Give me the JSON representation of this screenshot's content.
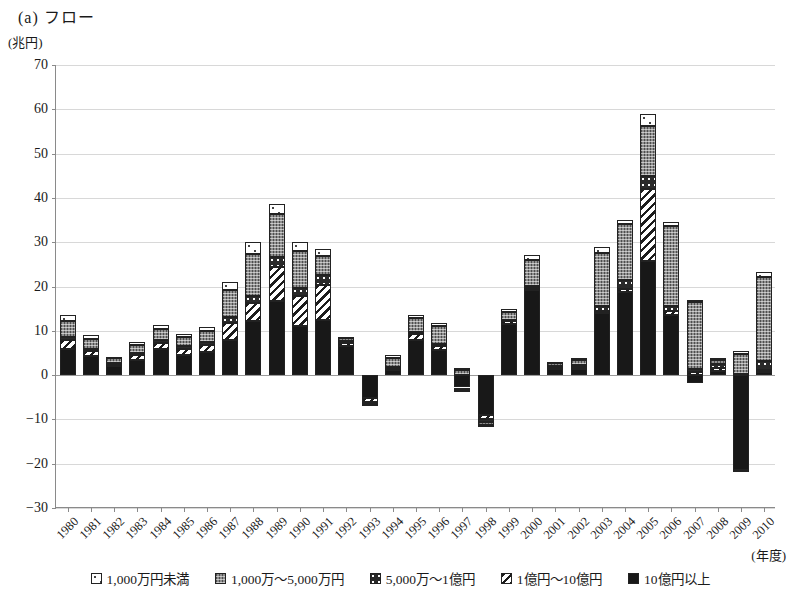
{
  "title": "(a) フロー",
  "y_unit": "(兆円)",
  "x_unit": "(年度)",
  "legend": [
    {
      "label": "1,000万円未満",
      "pattern": "p-white"
    },
    {
      "label": "1,000万～5,000万円",
      "pattern": "p-gray"
    },
    {
      "label": "5,000万～1億円",
      "pattern": "p-cross"
    },
    {
      "label": "1億円～10億円",
      "pattern": "p-diag"
    },
    {
      "label": "10億円以上",
      "pattern": "p-black"
    }
  ],
  "chart_data": {
    "type": "bar",
    "title": "(a) フロー",
    "xlabel": "(年度)",
    "ylabel": "(兆円)",
    "ylim": [
      -30,
      70
    ],
    "ytick_step": 10,
    "yticks": [
      70,
      60,
      50,
      40,
      30,
      20,
      10,
      0,
      "-10",
      "-20",
      "-30"
    ],
    "grid": true,
    "legend_position": "bottom",
    "stacked": true,
    "categories": [
      "1980",
      "1981",
      "1982",
      "1983",
      "1984",
      "1985",
      "1986",
      "1987",
      "1988",
      "1989",
      "1990",
      "1991",
      "1992",
      "1993",
      "1994",
      "1995",
      "1996",
      "1997",
      "1998",
      "1999",
      "2000",
      "2001",
      "2002",
      "2003",
      "2004",
      "2005",
      "2006",
      "2007",
      "2008",
      "2009",
      "2010"
    ],
    "series": [
      {
        "name": "10億円以上",
        "pattern": "p-black",
        "values": [
          6.0,
          4.3,
          2.0,
          3.5,
          6.0,
          4.6,
          5.3,
          8.0,
          12.2,
          16.8,
          11.0,
          12.5,
          6.5,
          -5.2,
          1.2,
          8.0,
          5.6,
          -2.8,
          -9.0,
          11.5,
          19.2,
          1.3,
          1.4,
          14.0,
          18.8,
          25.8,
          13.5,
          -1.8,
          1.0,
          -21.5,
          0.6
        ]
      },
      {
        "name": "1億円～10億円",
        "pattern": "p-diag",
        "values": [
          2.0,
          1.2,
          0.5,
          1.0,
          1.3,
          1.4,
          1.6,
          3.8,
          4.0,
          7.6,
          6.8,
          7.8,
          0.8,
          -0.8,
          0.4,
          1.2,
          0.9,
          -0.6,
          -1.0,
          0.6,
          0.5,
          0.4,
          0.5,
          0.5,
          0.7,
          16.2,
          1.0,
          0.8,
          0.6,
          -0.2,
          0.5
        ]
      },
      {
        "name": "5,000万～1億円",
        "pattern": "p-cross",
        "values": [
          0.7,
          0.4,
          0.3,
          0.4,
          0.6,
          0.5,
          0.6,
          1.3,
          1.6,
          2.2,
          1.9,
          2.2,
          0.4,
          -0.3,
          0.3,
          0.6,
          0.5,
          -0.3,
          -0.5,
          0.4,
          0.4,
          0.3,
          0.4,
          1.0,
          2.0,
          3.0,
          1.2,
          0.6,
          1.0,
          0.2,
          2.0
        ]
      },
      {
        "name": "1,000万～5,000万円",
        "pattern": "p-gray",
        "values": [
          3.4,
          2.2,
          1.0,
          2.0,
          2.6,
          2.2,
          2.4,
          6.0,
          9.6,
          9.8,
          8.3,
          4.4,
          0.6,
          -0.2,
          2.0,
          3.0,
          4.1,
          1.2,
          -0.7,
          1.8,
          5.8,
          0.7,
          1.1,
          12.0,
          12.6,
          11.2,
          18.0,
          15.0,
          0.9,
          4.6,
          19.0
        ]
      },
      {
        "name": "1,000万円未満",
        "pattern": "p-white",
        "values": [
          1.5,
          0.9,
          0.3,
          0.6,
          0.8,
          0.6,
          0.9,
          1.9,
          2.6,
          2.2,
          2.0,
          1.6,
          0.2,
          -0.1,
          0.7,
          0.8,
          0.6,
          0.4,
          -0.2,
          0.6,
          1.1,
          0.3,
          0.4,
          1.4,
          1.0,
          2.8,
          0.9,
          0.6,
          0.3,
          0.6,
          1.2
        ]
      }
    ],
    "totals": [
      13.6,
      9.0,
      4.1,
      7.5,
      11.3,
      9.3,
      10.8,
      21.0,
      30.0,
      38.6,
      30.0,
      28.5,
      8.5,
      -6.6,
      4.6,
      13.6,
      11.7,
      1.9,
      -11.4,
      14.9,
      27.0,
      3.0,
      3.8,
      28.9,
      35.1,
      59.0,
      34.6,
      15.2,
      3.8,
      -16.3,
      23.3
    ]
  }
}
